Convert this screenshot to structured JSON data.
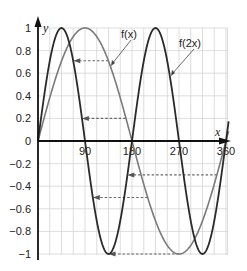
{
  "chart_data": {
    "type": "line",
    "title": "",
    "xlabel": "x",
    "ylabel": "y",
    "xlim": [
      0,
      360
    ],
    "ylim": [
      -1,
      1
    ],
    "x_ticks": [
      "90",
      "180",
      "270",
      "360"
    ],
    "y_ticks": [
      "1",
      "0.8",
      "0.6",
      "0.4",
      "0.2",
      "0",
      "-0.2",
      "-0.4",
      "-0.6",
      "-0.8",
      "-1"
    ],
    "grid": true,
    "series": [
      {
        "name": "f(x)",
        "function": "sin(x)",
        "color": "#7a7a7a",
        "x": [
          0,
          45,
          90,
          135,
          180,
          225,
          270,
          315,
          360
        ],
        "values": [
          0,
          0.71,
          1,
          0.71,
          0,
          -0.71,
          -1,
          -0.71,
          0
        ]
      },
      {
        "name": "f(2x)",
        "function": "sin(2x)",
        "color": "#2a2a2a",
        "x": [
          0,
          22.5,
          45,
          67.5,
          90,
          112.5,
          135,
          157.5,
          180,
          202.5,
          225,
          247.5,
          270,
          292.5,
          315,
          337.5,
          360
        ],
        "values": [
          0,
          0.71,
          1,
          0.71,
          0,
          -0.71,
          -1,
          -0.71,
          0,
          0.71,
          1,
          0.71,
          0,
          -0.71,
          -1,
          -0.71,
          0
        ]
      }
    ],
    "annotations": [
      {
        "type": "label",
        "text": "f(x)",
        "points_to": "f(x) curve near x=135"
      },
      {
        "type": "label",
        "text": "f(2x)",
        "points_to": "f(2x) curve near x=247"
      },
      {
        "type": "dashed-arrow",
        "y": 0.71,
        "from_x": 135,
        "to_x": 67.5
      },
      {
        "type": "dashed-arrow",
        "y": 0.2,
        "from_x": 168,
        "to_x": 84
      },
      {
        "type": "dashed-arrow",
        "y": -0.3,
        "from_x": 343,
        "to_x": 171
      },
      {
        "type": "dashed-arrow",
        "y": -0.5,
        "from_x": 210,
        "to_x": 105
      },
      {
        "type": "dashed-arrow",
        "y": -1,
        "from_x": 270,
        "to_x": 135
      }
    ]
  },
  "labels": {
    "y_axis": "y",
    "x_axis": "x",
    "fx": "f(x)",
    "f2x": "f(2x)",
    "x_ticks": [
      "90",
      "180",
      "270",
      "360"
    ],
    "y_ticks": [
      "1",
      "0.8",
      "0.6",
      "0.4",
      "0.2",
      "0",
      "−0.2",
      "−0.4",
      "−0.6",
      "−0.8",
      "−1"
    ]
  }
}
